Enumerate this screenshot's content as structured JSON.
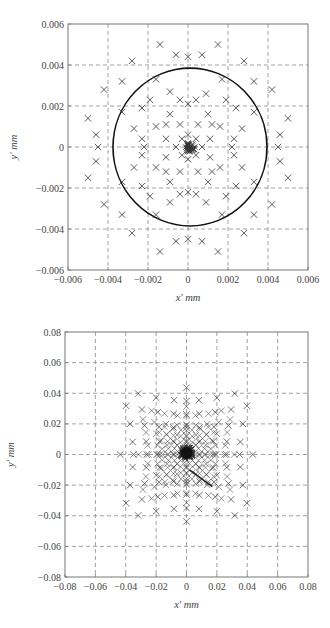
{
  "chart_data": [
    {
      "type": "scatter",
      "title": "",
      "xlabel": "x′ mm",
      "ylabel": "y′ mm",
      "xlim": [
        -0.006,
        0.006
      ],
      "ylim": [
        -0.006,
        0.006
      ],
      "grid": true,
      "grid_style": "dashed",
      "marker": "x",
      "xticks": [
        -0.006,
        -0.004,
        -0.002,
        0,
        0.002,
        0.004,
        0.006
      ],
      "yticks": [
        -0.006,
        -0.004,
        -0.002,
        0,
        0.002,
        0.004,
        0.006
      ],
      "xtick_labels": [
        "−0.006",
        "−0.004",
        "−0.002",
        "0",
        "0.002",
        "0.004",
        "0.006"
      ],
      "ytick_labels": [
        "−0.006",
        "−0.004",
        "−0.002",
        "0",
        "0.002",
        "0.004",
        "0.006"
      ],
      "circle": {
        "cx": 0.0001,
        "cy": 0.0,
        "r": 0.00385
      },
      "scale_note": "point coordinates in units of 1e-3 mm",
      "points": [
        [
          -1.4,
          5.0
        ],
        [
          1.5,
          5.0
        ],
        [
          -0.6,
          4.5
        ],
        [
          0.7,
          4.5
        ],
        [
          0,
          4.4
        ],
        [
          -2.8,
          4.2
        ],
        [
          2.8,
          4.2
        ],
        [
          -3.3,
          3.2
        ],
        [
          3.3,
          3.2
        ],
        [
          -4.2,
          2.8
        ],
        [
          4.2,
          2.8
        ],
        [
          -5.0,
          1.4
        ],
        [
          5.0,
          1.4
        ],
        [
          -4.6,
          0.6
        ],
        [
          4.6,
          0.6
        ],
        [
          -4.5,
          0
        ],
        [
          4.5,
          0
        ],
        [
          -4.6,
          -0.7
        ],
        [
          4.6,
          -0.7
        ],
        [
          -5.0,
          -1.5
        ],
        [
          5.0,
          -1.5
        ],
        [
          -4.2,
          -2.8
        ],
        [
          4.2,
          -2.8
        ],
        [
          -3.3,
          -3.3
        ],
        [
          3.3,
          -3.3
        ],
        [
          -2.8,
          -4.2
        ],
        [
          2.8,
          -4.2
        ],
        [
          -0.6,
          -4.6
        ],
        [
          0.7,
          -4.6
        ],
        [
          0,
          -4.5
        ],
        [
          -1.4,
          -5.1
        ],
        [
          1.5,
          -5.1
        ],
        [
          -1.6,
          3.3
        ],
        [
          1.7,
          3.3
        ],
        [
          -3.3,
          1.7
        ],
        [
          3.3,
          1.7
        ],
        [
          -3.3,
          -1.7
        ],
        [
          3.3,
          -1.7
        ],
        [
          -1.6,
          -3.3
        ],
        [
          1.7,
          -3.3
        ],
        [
          -0.9,
          2.7
        ],
        [
          0.9,
          2.6
        ],
        [
          -1.9,
          2.3
        ],
        [
          1.9,
          2.3
        ],
        [
          -0.4,
          2.3
        ],
        [
          0.4,
          2.3
        ],
        [
          0,
          2.1
        ],
        [
          -2.3,
          1.9
        ],
        [
          2.4,
          1.9
        ],
        [
          -0.9,
          1.6
        ],
        [
          1.0,
          1.6
        ],
        [
          -2.7,
          0.9
        ],
        [
          2.7,
          0.9
        ],
        [
          -1.6,
          1.0
        ],
        [
          1.6,
          1.0
        ],
        [
          -1.1,
          1.1
        ],
        [
          1.2,
          1.1
        ],
        [
          -0.4,
          1.1
        ],
        [
          0.5,
          1.1
        ],
        [
          -2.3,
          0.4
        ],
        [
          2.3,
          0.4
        ],
        [
          -2.2,
          0
        ],
        [
          2.2,
          0
        ],
        [
          -1.1,
          0.4
        ],
        [
          1.1,
          0.4
        ],
        [
          -2.3,
          -0.4
        ],
        [
          2.3,
          -0.4
        ],
        [
          -1.1,
          -0.5
        ],
        [
          1.1,
          -0.5
        ],
        [
          -2.7,
          -1.0
        ],
        [
          2.7,
          -1.0
        ],
        [
          -1.6,
          -1.0
        ],
        [
          1.6,
          -1.0
        ],
        [
          -1.1,
          -1.2
        ],
        [
          1.2,
          -1.2
        ],
        [
          -0.4,
          -1.2
        ],
        [
          0.5,
          -1.2
        ],
        [
          -0.9,
          -1.7
        ],
        [
          1.0,
          -1.7
        ],
        [
          -2.3,
          -1.9
        ],
        [
          2.4,
          -1.9
        ],
        [
          -1.9,
          -2.4
        ],
        [
          1.9,
          -2.4
        ],
        [
          -0.4,
          -2.3
        ],
        [
          0.4,
          -2.3
        ],
        [
          0,
          -2.2
        ],
        [
          -0.9,
          -2.7
        ],
        [
          0.9,
          -2.7
        ],
        [
          -0.6,
          0
        ],
        [
          0.7,
          0
        ],
        [
          -0.3,
          0.4
        ],
        [
          0.4,
          0.4
        ],
        [
          -0.3,
          -0.4
        ],
        [
          0.4,
          -0.4
        ],
        [
          0,
          0.6
        ],
        [
          0,
          -0.6
        ]
      ],
      "center_cluster": {
        "cx": 0.1,
        "cy": 0.0,
        "radius": 0.25,
        "count": 40
      }
    },
    {
      "type": "scatter",
      "title": "",
      "xlabel": "x′ mm",
      "ylabel": "y′ mm",
      "xlim": [
        -0.08,
        0.08
      ],
      "ylim": [
        -0.08,
        0.08
      ],
      "grid": true,
      "grid_style": "dashed",
      "marker": "x",
      "xticks": [
        -0.08,
        -0.06,
        -0.04,
        -0.02,
        0,
        0.02,
        0.04,
        0.06,
        0.08
      ],
      "yticks": [
        -0.08,
        -0.06,
        -0.04,
        -0.02,
        0,
        0.02,
        0.04,
        0.06,
        0.08
      ],
      "xtick_labels": [
        "−0.08",
        "−0.06",
        "−0.04",
        "−0.02",
        "0",
        "0.02",
        "0.04",
        "0.06",
        "0.08"
      ],
      "ytick_labels": [
        "−0.08",
        "−0.06",
        "−0.04",
        "−0.02",
        "0",
        "0.02",
        "0.04",
        "0.06",
        "0.08"
      ],
      "pattern": "pincushion-distorted spot diagram (star/astroid-shaped grid of ray intercepts with dense center)",
      "generator": {
        "grid_n": 11,
        "max_r": 0.045,
        "distortion_k": 0.55,
        "arc_curvature": 0.25
      },
      "extent": {
        "x": [
          -0.065,
          0.065
        ],
        "y": [
          -0.065,
          0.065
        ]
      },
      "center_cluster": {
        "cx": 0.0,
        "cy": 0.001,
        "radius": 0.004,
        "count": 60
      }
    }
  ]
}
